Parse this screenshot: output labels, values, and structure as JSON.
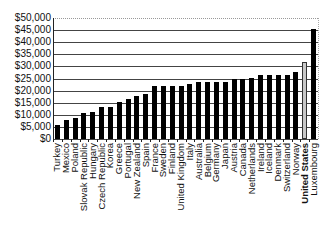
{
  "chart_data": {
    "type": "bar",
    "title": "",
    "xlabel": "",
    "ylabel": "",
    "ylim": [
      0,
      50000
    ],
    "yticks": [
      "$0",
      "$5,000",
      "$10,000",
      "$15,000",
      "$20,000",
      "$25,000",
      "$30,000",
      "$35,000",
      "$40,000",
      "$45,000",
      "$50,000"
    ],
    "grid": true,
    "legend": null,
    "highlight": "United States",
    "colors": {
      "default": "#000000",
      "highlight": "#c8c8c8"
    },
    "categories": [
      "Turkey",
      "Mexico",
      "Poland",
      "Slovak Republic",
      "Hungary",
      "Czech Republic",
      "Korea",
      "Greece",
      "Portugal",
      "New Zealand",
      "Spain",
      "France",
      "Sweden",
      "Finland",
      "United Kingdom",
      "Italy",
      "Australia",
      "Belgium",
      "Germany",
      "Japan",
      "Austria",
      "Canada",
      "Netherlands",
      "Ireland",
      "Iceland",
      "Denmark",
      "Switzerland",
      "Norway",
      "United States",
      "Luxembourg"
    ],
    "values": [
      5600,
      7900,
      8600,
      10900,
      11000,
      13100,
      13200,
      15300,
      16400,
      17900,
      18600,
      21700,
      22000,
      22000,
      22100,
      22600,
      23600,
      23600,
      23700,
      23700,
      24900,
      24900,
      25400,
      26400,
      26400,
      26500,
      26600,
      27600,
      32000,
      45400
    ]
  }
}
